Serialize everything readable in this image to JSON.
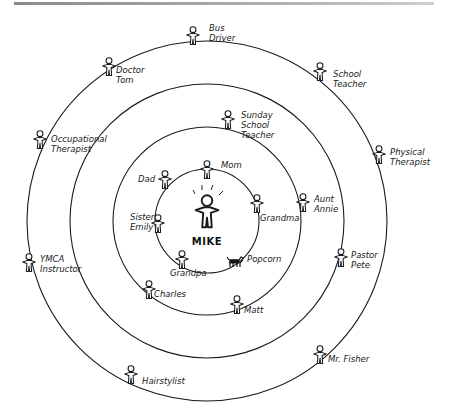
{
  "diagram": {
    "type": "concentric-relationship-circles",
    "center_person": {
      "label": "MIKE",
      "x": 207,
      "y": 212
    },
    "rings": [
      {
        "level": 1,
        "radius": 52
      },
      {
        "level": 2,
        "radius": 94
      },
      {
        "level": 3,
        "radius": 137
      },
      {
        "level": 4,
        "radius": 180
      }
    ],
    "people": [
      {
        "label": "Mom",
        "ring": 1,
        "x": 207,
        "y": 170,
        "lx": 221,
        "ly": 168,
        "line2": ""
      },
      {
        "label": "Dad",
        "ring": 1,
        "x": 165,
        "y": 180,
        "lx": 138,
        "ly": 182,
        "line2": ""
      },
      {
        "label": "Grandma",
        "ring": 1,
        "x": 257,
        "y": 204,
        "lx": 260,
        "ly": 221,
        "line2": ""
      },
      {
        "label": "Sister",
        "ring": 1,
        "x": 158,
        "y": 224,
        "lx": 130,
        "ly": 220,
        "line2": "Emily"
      },
      {
        "label": "Grandpa",
        "ring": 1,
        "x": 182,
        "y": 260,
        "lx": 170,
        "ly": 276,
        "line2": ""
      },
      {
        "label": "Popcorn",
        "ring": 1,
        "x": 235,
        "y": 262,
        "lx": 247,
        "ly": 262,
        "line2": "",
        "kind": "dog"
      },
      {
        "label": "Sunday",
        "ring": 2,
        "x": 228,
        "y": 120,
        "lx": 241,
        "ly": 118,
        "line2": "School",
        "line3": "Teacher"
      },
      {
        "label": "Aunt",
        "ring": 2,
        "x": 303,
        "y": 203,
        "lx": 314,
        "ly": 202,
        "line2": "Annie"
      },
      {
        "label": "Charles",
        "ring": 2,
        "x": 149,
        "y": 290,
        "lx": 154,
        "ly": 297,
        "line2": ""
      },
      {
        "label": "Matt",
        "ring": 2,
        "x": 237,
        "y": 305,
        "lx": 244,
        "ly": 313,
        "line2": ""
      },
      {
        "label": "Bus",
        "ring": 4,
        "x": 193,
        "y": 36,
        "lx": 209,
        "ly": 31,
        "line2": "Driver"
      },
      {
        "label": "Doctor",
        "ring": 4,
        "x": 109,
        "y": 67,
        "lx": 116,
        "ly": 73,
        "line2": "Tom"
      },
      {
        "label": "School",
        "ring": 4,
        "x": 320,
        "y": 72,
        "lx": 333,
        "ly": 77,
        "line2": "Teacher"
      },
      {
        "label": "Occupational",
        "ring": 4,
        "x": 40,
        "y": 140,
        "lx": 51,
        "ly": 142,
        "line2": "Therapist"
      },
      {
        "label": "Physical",
        "ring": 4,
        "x": 379,
        "y": 155,
        "lx": 390,
        "ly": 155,
        "line2": "Therapist"
      },
      {
        "label": "YMCA",
        "ring": 4,
        "x": 29,
        "y": 263,
        "lx": 40,
        "ly": 262,
        "line2": "Instructor"
      },
      {
        "label": "Pastor",
        "ring": 3,
        "x": 341,
        "y": 258,
        "lx": 351,
        "ly": 258,
        "line2": "Pete"
      },
      {
        "label": "Hairstylist",
        "ring": 4,
        "x": 131,
        "y": 375,
        "lx": 142,
        "ly": 384,
        "line2": ""
      },
      {
        "label": "Mr. Fisher",
        "ring": 4,
        "x": 320,
        "y": 355,
        "lx": 328,
        "ly": 362,
        "line2": ""
      }
    ],
    "colors": {
      "line": "#1c1c1c",
      "background": "#ffffff",
      "top_rule": "#9a9a9a"
    }
  }
}
